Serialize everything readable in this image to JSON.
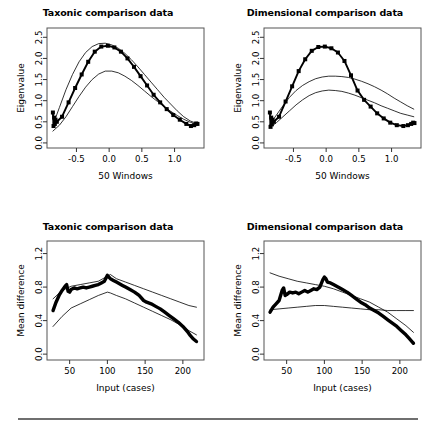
{
  "figure": {
    "background": "#ffffff",
    "foreground": "#000000",
    "rule_color": "#6f6f6f"
  },
  "chart_data": [
    {
      "id": "top-left",
      "type": "line",
      "title": "Taxonic comparison data",
      "xlabel": "50 Windows",
      "ylabel": "Eigenvalue",
      "xlim": [
        -0.95,
        1.45
      ],
      "ylim": [
        -0.12,
        2.72
      ],
      "xticks": [
        -0.5,
        0.0,
        0.5,
        1.0
      ],
      "xticklabels": [
        "-0.5",
        "0.0",
        "0.5",
        "1.0"
      ],
      "yticks": [
        0.0,
        0.5,
        1.0,
        1.5,
        2.0,
        2.5
      ],
      "yticklabels": [
        "0.0",
        "0.5",
        "1.0",
        "1.5",
        "2.0",
        "2.5"
      ],
      "grid": false,
      "legend": null,
      "series": [
        {
          "name": "observed",
          "style": "thick-line-with-square-markers",
          "markers": true,
          "x": [
            -0.86,
            -0.85,
            -0.84,
            -0.83,
            -0.82,
            -0.8,
            -0.72,
            -0.62,
            -0.52,
            -0.42,
            -0.32,
            -0.22,
            -0.12,
            -0.02,
            0.08,
            0.18,
            0.28,
            0.38,
            0.48,
            0.58,
            0.68,
            0.78,
            0.88,
            0.98,
            1.08,
            1.18,
            1.25,
            1.3,
            1.33,
            1.35
          ],
          "y": [
            0.72,
            0.4,
            0.6,
            0.45,
            0.55,
            0.5,
            0.62,
            0.96,
            1.3,
            1.62,
            1.92,
            2.16,
            2.28,
            2.3,
            2.26,
            2.16,
            2.0,
            1.8,
            1.58,
            1.36,
            1.14,
            0.96,
            0.8,
            0.66,
            0.55,
            0.45,
            0.4,
            0.42,
            0.46,
            0.45
          ]
        },
        {
          "name": "upper-comparison",
          "style": "thin-line",
          "markers": false,
          "x": [
            -0.86,
            -0.76,
            -0.66,
            -0.56,
            -0.46,
            -0.36,
            -0.26,
            -0.16,
            -0.06,
            0.04,
            0.14,
            0.24,
            0.34,
            0.44,
            0.54,
            0.64,
            0.74,
            0.84,
            0.94,
            1.04,
            1.14,
            1.24,
            1.34
          ],
          "y": [
            0.42,
            0.84,
            1.26,
            1.62,
            1.92,
            2.14,
            2.28,
            2.35,
            2.36,
            2.32,
            2.24,
            2.12,
            1.97,
            1.8,
            1.62,
            1.44,
            1.26,
            1.08,
            0.92,
            0.76,
            0.62,
            0.52,
            0.46
          ]
        },
        {
          "name": "lower-comparison",
          "style": "thin-line",
          "markers": false,
          "x": [
            -0.86,
            -0.76,
            -0.66,
            -0.56,
            -0.46,
            -0.36,
            -0.26,
            -0.16,
            -0.06,
            0.04,
            0.14,
            0.24,
            0.34,
            0.44,
            0.54,
            0.64,
            0.74,
            0.84,
            0.94,
            1.04,
            1.14,
            1.24,
            1.34
          ],
          "y": [
            0.28,
            0.42,
            0.62,
            0.86,
            1.1,
            1.32,
            1.5,
            1.63,
            1.7,
            1.7,
            1.66,
            1.58,
            1.48,
            1.36,
            1.23,
            1.1,
            0.98,
            0.86,
            0.75,
            0.65,
            0.56,
            0.49,
            0.44
          ]
        }
      ]
    },
    {
      "id": "top-right",
      "type": "line",
      "title": "Dimensional comparison data",
      "xlabel": "50 Windows",
      "ylabel": "Eigenvalue",
      "xlim": [
        -0.95,
        1.45
      ],
      "ylim": [
        -0.12,
        2.72
      ],
      "xticks": [
        -0.5,
        0.0,
        0.5,
        1.0
      ],
      "xticklabels": [
        "-0.5",
        "0.0",
        "0.5",
        "1.0"
      ],
      "yticks": [
        0.0,
        0.5,
        1.0,
        1.5,
        2.0,
        2.5
      ],
      "yticklabels": [
        "0.0",
        "0.5",
        "1.0",
        "1.5",
        "2.0",
        "2.5"
      ],
      "grid": false,
      "legend": null,
      "series": [
        {
          "name": "observed",
          "style": "thick-line-with-square-markers",
          "markers": true,
          "x": [
            -0.86,
            -0.85,
            -0.84,
            -0.83,
            -0.82,
            -0.8,
            -0.72,
            -0.62,
            -0.52,
            -0.42,
            -0.32,
            -0.22,
            -0.12,
            -0.02,
            0.08,
            0.18,
            0.28,
            0.38,
            0.48,
            0.58,
            0.68,
            0.78,
            0.88,
            0.98,
            1.08,
            1.18,
            1.25,
            1.3,
            1.33,
            1.35
          ],
          "y": [
            0.72,
            0.38,
            0.6,
            0.44,
            0.55,
            0.5,
            0.62,
            0.98,
            1.34,
            1.7,
            1.98,
            2.18,
            2.27,
            2.28,
            2.24,
            2.14,
            1.94,
            1.6,
            1.24,
            1.02,
            0.86,
            0.7,
            0.58,
            0.48,
            0.42,
            0.4,
            0.42,
            0.45,
            0.48,
            0.47
          ]
        },
        {
          "name": "upper-comparison",
          "style": "thin-line",
          "markers": false,
          "x": [
            -0.86,
            -0.76,
            -0.66,
            -0.56,
            -0.46,
            -0.36,
            -0.26,
            -0.16,
            -0.06,
            0.04,
            0.14,
            0.24,
            0.34,
            0.44,
            0.54,
            0.64,
            0.74,
            0.84,
            0.94,
            1.04,
            1.14,
            1.24,
            1.34
          ],
          "y": [
            0.44,
            0.66,
            0.88,
            1.08,
            1.24,
            1.36,
            1.45,
            1.52,
            1.56,
            1.58,
            1.58,
            1.57,
            1.55,
            1.51,
            1.46,
            1.4,
            1.33,
            1.25,
            1.16,
            1.06,
            0.97,
            0.88,
            0.8
          ]
        },
        {
          "name": "lower-comparison",
          "style": "thin-line",
          "markers": false,
          "x": [
            -0.86,
            -0.76,
            -0.66,
            -0.56,
            -0.46,
            -0.36,
            -0.26,
            -0.16,
            -0.06,
            0.04,
            0.14,
            0.24,
            0.34,
            0.44,
            0.54,
            0.64,
            0.74,
            0.84,
            0.94,
            1.04,
            1.14,
            1.24,
            1.34
          ],
          "y": [
            0.36,
            0.48,
            0.62,
            0.76,
            0.9,
            1.02,
            1.12,
            1.19,
            1.23,
            1.25,
            1.24,
            1.22,
            1.18,
            1.13,
            1.07,
            1.01,
            0.95,
            0.88,
            0.82,
            0.76,
            0.7,
            0.66,
            0.62
          ]
        }
      ]
    },
    {
      "id": "bottom-left",
      "type": "line",
      "title": "Taxonic comparison data",
      "xlabel": "Input (cases)",
      "ylabel": "Mean difference",
      "xlim": [
        20,
        228
      ],
      "ylim": [
        -0.07,
        1.35
      ],
      "xticks": [
        50,
        100,
        150,
        200
      ],
      "xticklabels": [
        "50",
        "100",
        "150",
        "200"
      ],
      "yticks": [
        0.0,
        0.4,
        0.8,
        1.2
      ],
      "yticklabels": [
        "0.0",
        "0.4",
        "0.8",
        "1.2"
      ],
      "grid": false,
      "legend": null,
      "series": [
        {
          "name": "observed",
          "style": "very-thick-line",
          "markers": false,
          "x": [
            28,
            32,
            36,
            40,
            44,
            46,
            48,
            50,
            52,
            56,
            60,
            64,
            68,
            72,
            76,
            80,
            84,
            88,
            92,
            96,
            100,
            102,
            104,
            108,
            112,
            116,
            120,
            124,
            130,
            136,
            142,
            148,
            152,
            158,
            164,
            170,
            176,
            182,
            188,
            194,
            200,
            206,
            210,
            214,
            218
          ],
          "y": [
            0.52,
            0.62,
            0.7,
            0.76,
            0.81,
            0.83,
            0.75,
            0.74,
            0.77,
            0.79,
            0.78,
            0.79,
            0.8,
            0.79,
            0.8,
            0.81,
            0.82,
            0.83,
            0.85,
            0.87,
            0.94,
            0.92,
            0.9,
            0.88,
            0.86,
            0.84,
            0.82,
            0.8,
            0.77,
            0.74,
            0.7,
            0.64,
            0.62,
            0.6,
            0.57,
            0.54,
            0.5,
            0.46,
            0.42,
            0.38,
            0.33,
            0.27,
            0.22,
            0.18,
            0.15
          ]
        },
        {
          "name": "upper-comparison",
          "style": "thin-line",
          "markers": false,
          "x": [
            28,
            40,
            52,
            64,
            76,
            88,
            100,
            104,
            112,
            124,
            136,
            148,
            160,
            172,
            184,
            196,
            208,
            218
          ],
          "y": [
            0.66,
            0.76,
            0.81,
            0.83,
            0.85,
            0.87,
            0.93,
            0.95,
            0.9,
            0.86,
            0.82,
            0.78,
            0.74,
            0.7,
            0.66,
            0.62,
            0.58,
            0.56
          ]
        },
        {
          "name": "lower-comparison",
          "style": "thin-line",
          "markers": false,
          "x": [
            28,
            40,
            52,
            64,
            76,
            88,
            100,
            104,
            112,
            124,
            136,
            148,
            160,
            172,
            184,
            196,
            208,
            218
          ],
          "y": [
            0.33,
            0.45,
            0.55,
            0.6,
            0.65,
            0.7,
            0.74,
            0.73,
            0.7,
            0.66,
            0.61,
            0.56,
            0.51,
            0.46,
            0.41,
            0.35,
            0.28,
            0.23
          ]
        }
      ]
    },
    {
      "id": "bottom-right",
      "type": "line",
      "title": "Dimensional comparison data",
      "xlabel": "Input (cases)",
      "ylabel": "Mean difference",
      "xlim": [
        20,
        228
      ],
      "ylim": [
        -0.07,
        1.35
      ],
      "xticks": [
        50,
        100,
        150,
        200
      ],
      "xticklabels": [
        "50",
        "100",
        "150",
        "200"
      ],
      "yticks": [
        0.0,
        0.4,
        0.8,
        1.2
      ],
      "yticklabels": [
        "0.0",
        "0.4",
        "0.8",
        "1.2"
      ],
      "grid": false,
      "legend": null,
      "series": [
        {
          "name": "observed",
          "style": "very-thick-line",
          "markers": false,
          "x": [
            28,
            32,
            36,
            40,
            44,
            46,
            48,
            50,
            54,
            58,
            62,
            66,
            70,
            74,
            78,
            82,
            86,
            90,
            94,
            98,
            100,
            102,
            104,
            108,
            112,
            118,
            124,
            130,
            136,
            142,
            148,
            154,
            160,
            166,
            172,
            178,
            184,
            190,
            196,
            202,
            208,
            212,
            216,
            218
          ],
          "y": [
            0.5,
            0.56,
            0.6,
            0.64,
            0.76,
            0.79,
            0.7,
            0.71,
            0.74,
            0.73,
            0.74,
            0.72,
            0.74,
            0.76,
            0.74,
            0.76,
            0.78,
            0.77,
            0.8,
            0.89,
            0.92,
            0.9,
            0.86,
            0.85,
            0.83,
            0.8,
            0.77,
            0.74,
            0.7,
            0.66,
            0.62,
            0.59,
            0.55,
            0.52,
            0.49,
            0.45,
            0.41,
            0.37,
            0.33,
            0.28,
            0.23,
            0.19,
            0.15,
            0.13
          ]
        },
        {
          "name": "upper-comparison",
          "style": "thin-line",
          "markers": false,
          "x": [
            28,
            40,
            52,
            64,
            76,
            88,
            100,
            112,
            124,
            136,
            148,
            160,
            172,
            184,
            196,
            208,
            218
          ],
          "y": [
            0.97,
            0.93,
            0.9,
            0.87,
            0.85,
            0.83,
            0.81,
            0.78,
            0.74,
            0.7,
            0.66,
            0.62,
            0.56,
            0.5,
            0.42,
            0.34,
            0.26
          ]
        },
        {
          "name": "lower-comparison",
          "style": "thin-line",
          "markers": false,
          "x": [
            28,
            40,
            52,
            64,
            76,
            88,
            100,
            112,
            124,
            136,
            148,
            160,
            172,
            184,
            196,
            208,
            218
          ],
          "y": [
            0.53,
            0.54,
            0.55,
            0.56,
            0.57,
            0.58,
            0.58,
            0.57,
            0.56,
            0.55,
            0.54,
            0.53,
            0.53,
            0.52,
            0.52,
            0.52,
            0.52
          ]
        }
      ]
    }
  ]
}
